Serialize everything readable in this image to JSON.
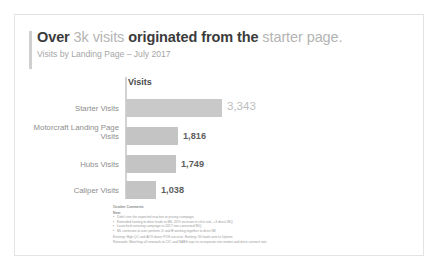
{
  "header": {
    "title_parts": [
      {
        "text": "Over ",
        "muted": false
      },
      {
        "text": "3k visits ",
        "muted": true
      },
      {
        "text": "originated from the ",
        "muted": false
      },
      {
        "text": "starter page.",
        "muted": true
      }
    ],
    "title_plain": "Over 3k visits originated from the starter page.",
    "subtitle": "Visits by Landing Page – July 2017"
  },
  "chart_data": {
    "type": "bar",
    "orientation": "horizontal",
    "title": "Over 3k visits originated from the starter page.",
    "subtitle": "Visits by Landing Page – July 2017",
    "column_header": "Visits",
    "xlabel": "",
    "ylabel": "",
    "categories": [
      "Starter Visits",
      "Motorcraft Landing Page Visits",
      "Hubs Visits",
      "Caliper Visits"
    ],
    "values": [
      3343,
      1816,
      1749,
      1038
    ],
    "value_labels": [
      "3,343",
      "1,816",
      "1,749",
      "1,038"
    ],
    "xlim": [
      0,
      3343
    ],
    "grid": false,
    "legend": "none",
    "bar_color": "#c4c4c4",
    "highlight_label_color": "#bdbdbd",
    "label_color": "#5e5e5e"
  },
  "comments": {
    "title": "October Comments",
    "new_label": "New:",
    "bullets": [
      "Didn't see the expected reaction to pricing campaign.",
      "Extended hosting to drive leads to M6, 20% increase in click rate, +3 direct INQ",
      "Launched nurturing campaign to 2017 non-converted INQ.",
      "ML continues to over perform, D and B working together to drive N8"
    ],
    "footer_lines": [
      "Existing:  High QC and AOV drove POS success.   Hosting:  30 leads sent to Uptime",
      "Renewals:  Matching all renewals to CIC and NABS reps to incorporate into motion and drive connect rate"
    ]
  }
}
